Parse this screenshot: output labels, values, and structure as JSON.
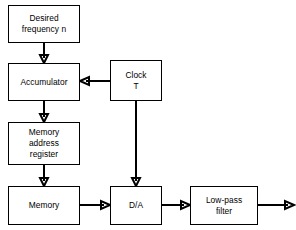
{
  "diagram": {
    "background_color": "#ffffff",
    "line_color": "#000000",
    "blocks": [
      {
        "id": "desired-frequency",
        "label": "Desired\nfrequency n",
        "x": 8,
        "y": 5,
        "w": 72,
        "h": 38
      },
      {
        "id": "accumulator",
        "label": "Accumulator",
        "x": 8,
        "y": 63,
        "w": 72,
        "h": 38
      },
      {
        "id": "clock",
        "label": "Clock\nT",
        "x": 110,
        "y": 60,
        "w": 52,
        "h": 41
      },
      {
        "id": "memory-address-register",
        "label": "Memory\naddress\nregister",
        "x": 8,
        "y": 122,
        "w": 72,
        "h": 43
      },
      {
        "id": "memory",
        "label": "Memory",
        "x": 8,
        "y": 186,
        "w": 72,
        "h": 39
      },
      {
        "id": "da-converter",
        "label": "D/A",
        "x": 110,
        "y": 186,
        "w": 52,
        "h": 39
      },
      {
        "id": "low-pass-filter",
        "label": "Low-pass\nfilter",
        "x": 190,
        "y": 186,
        "w": 68,
        "h": 39
      }
    ],
    "connections": [
      {
        "id": "desired-to-accumulator",
        "from": "desired-frequency",
        "to": "accumulator",
        "direction": "down"
      },
      {
        "id": "accumulator-to-mar",
        "from": "accumulator",
        "to": "memory-address-register",
        "direction": "down"
      },
      {
        "id": "mar-to-memory",
        "from": "memory-address-register",
        "to": "memory",
        "direction": "down"
      },
      {
        "id": "clock-to-accumulator",
        "from": "clock",
        "to": "accumulator",
        "direction": "left"
      },
      {
        "id": "clock-to-da",
        "from": "clock",
        "to": "da-converter",
        "direction": "down"
      },
      {
        "id": "memory-to-da",
        "from": "memory",
        "to": "da-converter",
        "direction": "right"
      },
      {
        "id": "da-to-filter",
        "from": "da-converter",
        "to": "low-pass-filter",
        "direction": "right"
      },
      {
        "id": "filter-output",
        "from": "low-pass-filter",
        "to": "output",
        "direction": "right"
      }
    ]
  }
}
